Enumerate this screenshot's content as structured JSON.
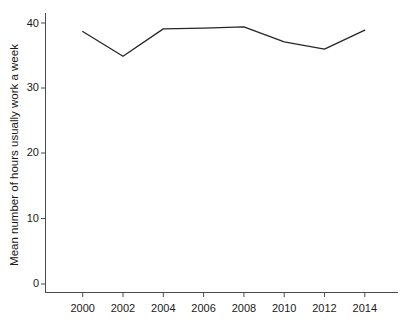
{
  "chart_data": {
    "type": "line",
    "title": "",
    "subtitle": "",
    "xlabel": "",
    "ylabel": "Mean number of hours usually work a week",
    "x": [
      2000,
      2002,
      2004,
      2006,
      2008,
      2010,
      2012,
      2014
    ],
    "values": [
      38.7,
      34.9,
      39.1,
      39.2,
      39.4,
      37.1,
      36.0,
      38.9
    ],
    "series": [
      {
        "name": "Mean number of hours usually work a week",
        "values": [
          38.7,
          34.9,
          39.1,
          39.2,
          39.4,
          37.1,
          36.0,
          38.9
        ]
      }
    ],
    "xtick_labels": [
      "2000",
      "2002",
      "2004",
      "2006",
      "2008",
      "2010",
      "2012",
      "2014"
    ],
    "ytick_labels": [
      "0",
      "10",
      "20",
      "30",
      "40"
    ],
    "ytick_values": [
      0,
      10,
      20,
      30,
      40
    ],
    "xlim": [
      1999,
      2015
    ],
    "ylim": [
      0,
      42
    ],
    "grid": false,
    "legend": false,
    "legend_position": "none",
    "line_color": "#262626",
    "axis_color": "#4c4c4c",
    "background_color": "#ffffff",
    "annotations": []
  },
  "axis": {
    "y_label": "Mean number of hours usually work a week",
    "y_ticks": [
      "0",
      "10",
      "20",
      "30",
      "40"
    ],
    "x_ticks": [
      "2000",
      "2002",
      "2004",
      "2006",
      "2008",
      "2010",
      "2012",
      "2014"
    ]
  }
}
